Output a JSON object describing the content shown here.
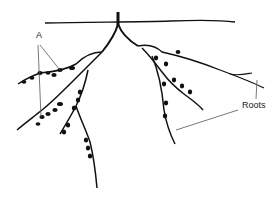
{
  "diagram": {
    "type": "root system with nodules",
    "labels": {
      "nodules": "A",
      "roots": "Roots"
    },
    "colors": {
      "ink": "#111111",
      "leader": "#555555",
      "background": "#ffffff"
    }
  }
}
